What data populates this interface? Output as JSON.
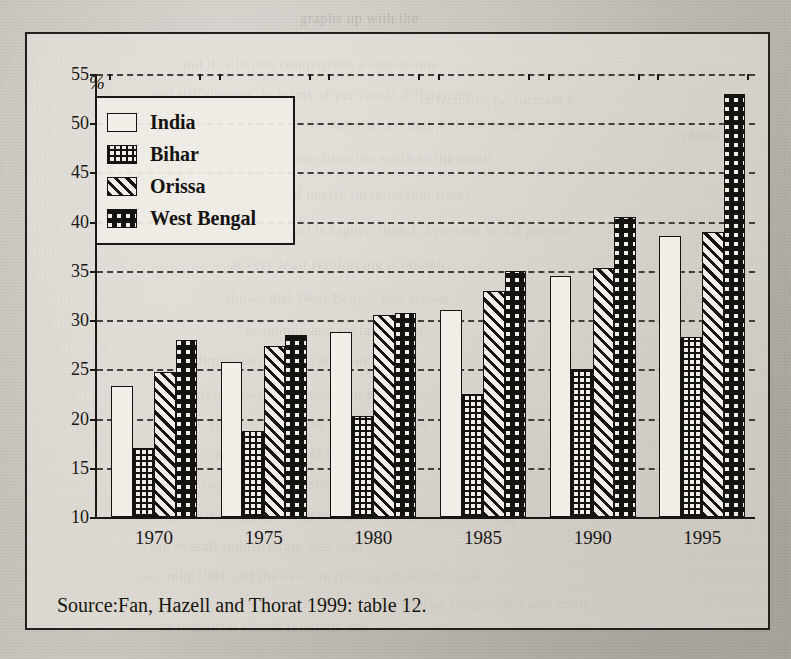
{
  "figure": {
    "caption": "Source:Fan, Hazell and Thorat 1999: table 12.",
    "unit_label": "%"
  },
  "legend": {
    "position": "top-left-inside",
    "items": [
      {
        "label": "India",
        "pattern": "empty-white"
      },
      {
        "label": "Bihar",
        "pattern": "fine-grid-mesh"
      },
      {
        "label": "Orissa",
        "pattern": "diagonal-stripes"
      },
      {
        "label": "West Bengal",
        "pattern": "large-checkerboard"
      }
    ]
  },
  "chart_data": {
    "type": "bar",
    "title": "",
    "xlabel": "",
    "ylabel": "%",
    "categories": [
      "1970",
      "1975",
      "1980",
      "1985",
      "1990",
      "1995"
    ],
    "ylim": [
      10,
      55
    ],
    "yticks": [
      10,
      15,
      20,
      25,
      30,
      35,
      40,
      45,
      50,
      55
    ],
    "grid": true,
    "legend_position": "upper left",
    "series": [
      {
        "name": "India",
        "values": [
          23.3,
          25.7,
          28.8,
          31.0,
          34.5,
          38.5
        ]
      },
      {
        "name": "Bihar",
        "values": [
          17.0,
          18.7,
          20.3,
          22.5,
          25.0,
          28.3
        ]
      },
      {
        "name": "Orissa",
        "values": [
          24.7,
          27.4,
          30.5,
          33.0,
          35.3,
          39.0
        ]
      },
      {
        "name": "West Bengal",
        "values": [
          28.0,
          28.5,
          30.7,
          35.0,
          40.5,
          53.0
        ]
      }
    ]
  },
  "ghost_text": [
    {
      "t": "graphs up with the",
      "x": 300,
      "y": 10
    },
    {
      "t": "and it is in this comparison a one-to-one",
      "x": 180,
      "y": 56
    },
    {
      "t": "and still dispute. In terms of per capita differences",
      "x": 150,
      "y": 86
    },
    {
      "t": "small 1.3 percent above the national average but, the mean",
      "x": 150,
      "y": 116
    },
    {
      "t": "result is a marked drop from the south to the north",
      "x": 170,
      "y": 150
    },
    {
      "t": "in 1970 a level of nearly three-to-four times",
      "x": 190,
      "y": 186
    },
    {
      "t": "the aggregate level is higher, then 1.3 percent to 2.2 percent",
      "x": 190,
      "y": 222
    },
    {
      "t": "at very least reinforcing economic",
      "x": 230,
      "y": 256
    },
    {
      "t": "shows that West Bengal had grown",
      "x": 225,
      "y": 290
    },
    {
      "t": "economic and social system",
      "x": 245,
      "y": 322
    },
    {
      "t": "dimension of this variation is that",
      "x": 195,
      "y": 352
    },
    {
      "t": "a trend toward inequality in economic",
      "x": 185,
      "y": 386
    },
    {
      "t": "rural to urban and even unmarried",
      "x": 210,
      "y": 416
    },
    {
      "t": "as the balance of the population",
      "x": 215,
      "y": 446
    },
    {
      "t": "a rate of growth that is significantly",
      "x": 190,
      "y": 476
    },
    {
      "t": "by the 1990s the impact of the comparison was already taking",
      "x": 120,
      "y": 508
    },
    {
      "t": "the overall industry rate was over",
      "x": 150,
      "y": 538
    },
    {
      "t": "since mid 1991 and the ever-increasing urban and rural",
      "x": 130,
      "y": 568
    },
    {
      "t": "in industrial labour relations and",
      "x": 160,
      "y": 618
    },
    {
      "t": "a similar comparison was made",
      "x": 390,
      "y": 596
    },
    {
      "t": "in terms of performance",
      "x": 420,
      "y": 92
    },
    {
      "t": "variation",
      "x": 680,
      "y": 126
    }
  ]
}
